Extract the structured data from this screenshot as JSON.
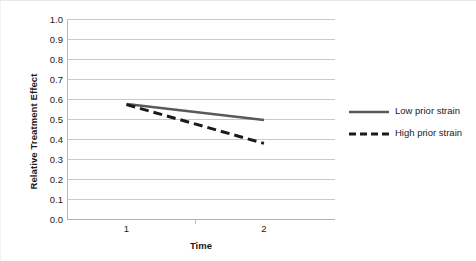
{
  "chart_data": {
    "type": "line",
    "title": "",
    "xlabel": "Time",
    "ylabel": "Relative Treatment Effect",
    "x": [
      1,
      2
    ],
    "xticklabels": [
      "1",
      "2"
    ],
    "xlim": [
      1,
      2
    ],
    "ylim": [
      0.0,
      1.0
    ],
    "yticklabels": [
      "1.0",
      "0.9",
      "0.8",
      "0.7",
      "0.6",
      "0.5",
      "0.4",
      "0.3",
      "0.2",
      "0.1",
      "0.0"
    ],
    "ytickvalues": [
      1.0,
      0.9,
      0.8,
      0.7,
      0.6,
      0.5,
      0.4,
      0.3,
      0.2,
      0.1,
      0.0
    ],
    "grid": "horizontal",
    "legend_position": "right",
    "series": [
      {
        "name": "Low prior strain",
        "values": [
          0.575,
          0.495
        ],
        "style": "solid",
        "color": "#595959",
        "width": 2.6
      },
      {
        "name": "High prior strain",
        "values": [
          0.572,
          0.378
        ],
        "style": "dashed",
        "color": "#1a1a1a",
        "width": 3.0,
        "dasharray": "9,5"
      }
    ]
  },
  "axes": {
    "y_title": "Relative Treatment Effect",
    "x_title": "Time",
    "gridline_color": "#c9c9c9",
    "axis_color": "#b8b8b8"
  },
  "legend": {
    "items": [
      {
        "label": "Low prior strain",
        "swatch": "solid-line-swatch"
      },
      {
        "label": "High prior strain",
        "swatch": "dashed-line-swatch"
      }
    ]
  }
}
